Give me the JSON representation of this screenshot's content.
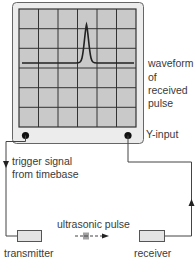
{
  "diagram": {
    "type": "oscilloscope-ultrasound-setup",
    "labels": {
      "waveform": [
        "waveform",
        "of",
        "received",
        "pulse"
      ],
      "y_input": "Y-input",
      "trigger": [
        "trigger signal",
        "from timebase"
      ],
      "pulse": "ultrasonic pulse",
      "transmitter": "transmitter",
      "receiver": "receiver"
    },
    "colors": {
      "frame_fill": "#ececec",
      "screen_fill": "#c9c9c9",
      "grid_line": "#333333",
      "wire": "#444444",
      "box_fill": "#e4e4e4"
    },
    "grid": {
      "cols": 6,
      "rows": 6
    }
  }
}
